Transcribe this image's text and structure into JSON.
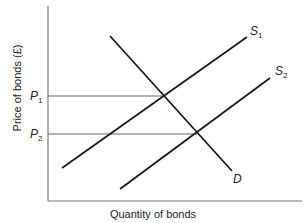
{
  "chart_data": {
    "type": "line",
    "title": "",
    "xlabel": "Quantity of bonds",
    "ylabel": "Price of bonds (£)",
    "grid": false,
    "y_ticks": [
      {
        "label": "P",
        "sub": "1",
        "y_px": 96
      },
      {
        "label": "P",
        "sub": "2",
        "y_px": 134
      }
    ],
    "series": [
      {
        "name": "D",
        "label": "D",
        "sub": "",
        "kind": "demand",
        "x1": 110,
        "y1": 36,
        "x2": 232,
        "y2": 171,
        "label_x": 233,
        "label_y": 183
      },
      {
        "name": "S1",
        "label": "S",
        "sub": "1",
        "kind": "supply",
        "x1": 62,
        "y1": 168,
        "x2": 247,
        "y2": 37,
        "label_x": 250,
        "label_y": 35
      },
      {
        "name": "S2",
        "label": "S",
        "sub": "2",
        "kind": "supply",
        "x1": 120,
        "y1": 189,
        "x2": 270,
        "y2": 78,
        "label_x": 275,
        "label_y": 75
      }
    ],
    "guides": [
      {
        "name": "P1-guide",
        "y": 96,
        "x_end": 163
      },
      {
        "name": "P2-guide",
        "y": 134,
        "x_end": 197
      }
    ],
    "equilibria": [
      {
        "name": "E1",
        "between": [
          "D",
          "S1"
        ],
        "price": "P1"
      },
      {
        "name": "E2",
        "between": [
          "D",
          "S2"
        ],
        "price": "P2"
      }
    ],
    "annotations": [
      "S1",
      "S2",
      "D",
      "P1",
      "P2"
    ]
  }
}
